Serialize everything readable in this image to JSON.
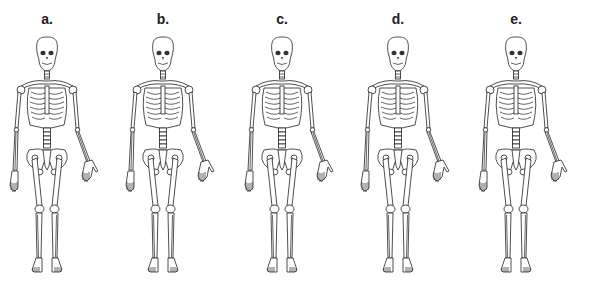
{
  "figure": {
    "panels": [
      {
        "label": "a.",
        "center_x": 47,
        "variant": "skeleton-anterior-view"
      },
      {
        "label": "b.",
        "center_x": 163,
        "variant": "skeleton-anterior-view"
      },
      {
        "label": "c.",
        "center_x": 282,
        "variant": "skeleton-anterior-view"
      },
      {
        "label": "d.",
        "center_x": 398,
        "variant": "skeleton-anterior-view"
      },
      {
        "label": "e.",
        "center_x": 516,
        "variant": "skeleton-anterior-view"
      }
    ]
  }
}
